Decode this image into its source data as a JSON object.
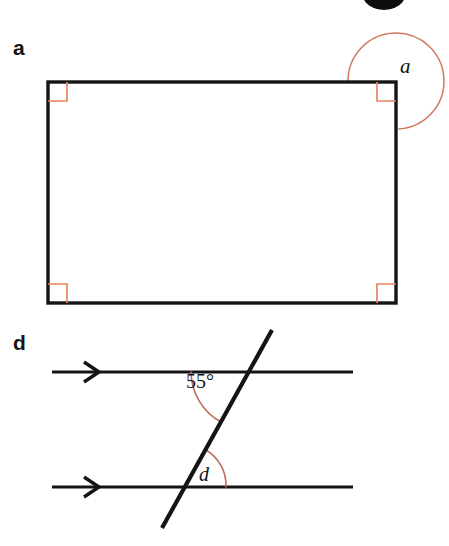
{
  "page": {
    "background_color": "#ffffff",
    "width": 449,
    "height": 546,
    "ink_color": "#141414",
    "arc_color": "#d4765c",
    "right_angle_color": "#e8845f"
  },
  "top_decoration": {
    "name": "black-ellipse-marker",
    "description": "partially cropped solid black ellipse at top edge",
    "color": "#0d0d0d"
  },
  "parts": [
    {
      "id": "a",
      "label": "a",
      "type": "rectangle-with-reflex-angle",
      "shape": {
        "name": "rectangle",
        "x": 48,
        "y": 82,
        "width": 348,
        "height": 221,
        "stroke": "#141414",
        "stroke_width": 3
      },
      "right_angle_markers": [
        {
          "corner": "top-left",
          "size": 18
        },
        {
          "corner": "top-right",
          "size": 18
        },
        {
          "corner": "bottom-left",
          "size": 18
        },
        {
          "corner": "bottom-right",
          "size": 18
        }
      ],
      "angle": {
        "name": "a",
        "label": "a",
        "kind": "reflex",
        "vertex": "top-right-corner",
        "value_shown": "",
        "arc_color": "#d4765c"
      }
    },
    {
      "id": "d",
      "label": "d",
      "type": "parallel-lines-transversal",
      "parallel_lines": [
        {
          "name": "upper-parallel-line",
          "x1": 52,
          "y1": 372,
          "x2": 353,
          "y2": 372,
          "arrow_marker": true
        },
        {
          "name": "lower-parallel-line",
          "x1": 52,
          "y1": 487,
          "x2": 353,
          "y2": 487,
          "arrow_marker": true
        }
      ],
      "transversal": {
        "name": "transversal-line",
        "x1": 272,
        "y1": 330,
        "x2": 162,
        "y2": 528
      },
      "angles": [
        {
          "name": "angle-55",
          "label": "55°",
          "kind": "known",
          "vertex": "upper-intersection",
          "arc_color": "#c06a5a"
        },
        {
          "name": "angle-d",
          "label": "d",
          "kind": "unknown",
          "vertex": "lower-intersection",
          "arc_color": "#c06a5a"
        }
      ]
    }
  ]
}
